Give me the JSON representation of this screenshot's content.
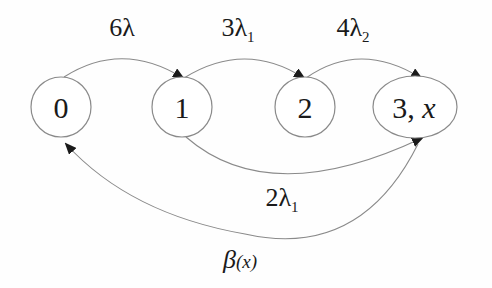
{
  "diagram": {
    "type": "state-transition",
    "nodes": [
      {
        "id": "0",
        "label": "0"
      },
      {
        "id": "1",
        "label": "1"
      },
      {
        "id": "2",
        "label": "2"
      },
      {
        "id": "3x",
        "label_main": "3, ",
        "label_var": "x"
      }
    ],
    "edges": [
      {
        "from": "0",
        "to": "1",
        "label_main": "6λ",
        "label_sub": ""
      },
      {
        "from": "1",
        "to": "2",
        "label_main": "3λ",
        "label_sub": "1"
      },
      {
        "from": "2",
        "to": "3x",
        "label_main": "4λ",
        "label_sub": "2"
      },
      {
        "from": "1",
        "to": "3x",
        "label_main": "2λ",
        "label_sub": "1"
      },
      {
        "from": "3x",
        "to": "0",
        "label_main": "β",
        "label_sub": "(x)"
      }
    ]
  }
}
